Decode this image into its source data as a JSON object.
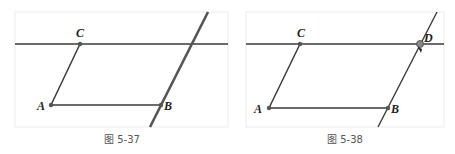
{
  "figures": [
    {
      "caption": "图 5-37",
      "labels": {
        "A": "A",
        "B": "B",
        "C": "C"
      }
    },
    {
      "caption": "图 5-38",
      "labels": {
        "A": "A",
        "B": "B",
        "C": "C",
        "D": "D"
      }
    }
  ],
  "colors": {
    "line": "#3a3a3a",
    "point": "#555555",
    "border": "#ebebeb"
  }
}
